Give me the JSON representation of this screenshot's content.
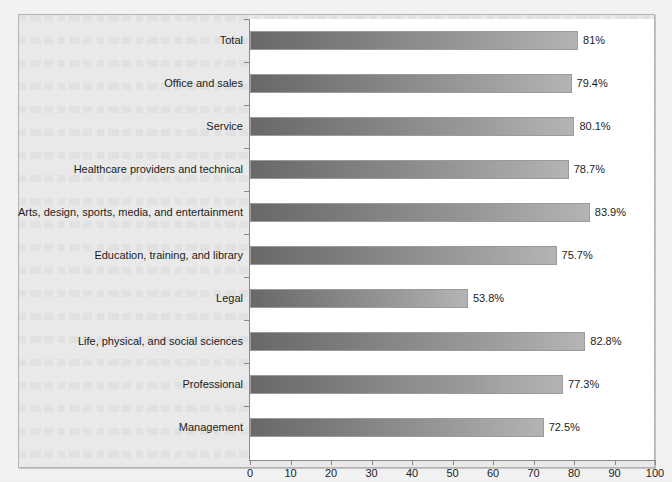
{
  "chart_data": {
    "type": "bar",
    "orientation": "horizontal",
    "title": "",
    "subtitle": "",
    "xlabel": "",
    "ylabel": "",
    "xlim": [
      0,
      100
    ],
    "xticks": [
      0,
      10,
      20,
      30,
      40,
      50,
      60,
      70,
      80,
      90,
      100
    ],
    "grid": false,
    "legend": null,
    "value_label_suffix": "%",
    "categories": [
      "Total",
      "Office and sales",
      "Service",
      "Healthcare providers and technical",
      "Arts, design, sports, media, and entertainment",
      "Education, training, and library",
      "Legal",
      "Life, physical, and social sciences",
      "Professional",
      "Management"
    ],
    "values": [
      81,
      79.4,
      80.1,
      78.7,
      83.9,
      75.7,
      53.8,
      82.8,
      77.3,
      72.5
    ],
    "value_labels": [
      "81%",
      "79.4%",
      "80.1%",
      "78.7%",
      "83.9%",
      "75.7%",
      "53.8%",
      "82.8%",
      "77.3%",
      "72.5%"
    ],
    "bars": [
      {
        "category": "Total",
        "value": 81,
        "label": "81%"
      },
      {
        "category": "Office and sales",
        "value": 79.4,
        "label": "79.4%"
      },
      {
        "category": "Service",
        "value": 80.1,
        "label": "80.1%"
      },
      {
        "category": "Healthcare providers and technical",
        "value": 78.7,
        "label": "78.7%"
      },
      {
        "category": "Arts, design, sports, media, and entertainment",
        "value": 83.9,
        "label": "83.9%"
      },
      {
        "category": "Education, training, and library",
        "value": 75.7,
        "label": "75.7%"
      },
      {
        "category": "Legal",
        "value": 53.8,
        "label": "53.8%"
      },
      {
        "category": "Life, physical, and social sciences",
        "value": 82.8,
        "label": "82.8%"
      },
      {
        "category": "Professional",
        "value": 77.3,
        "label": "77.3%"
      },
      {
        "category": "Management",
        "value": 72.5,
        "label": "72.5%"
      }
    ],
    "colors": {
      "bar_gradient_start": "#686868",
      "bar_gradient_end": "#b4b4b4",
      "bar_border": "#9b9b9b",
      "plot_background": "#ffffff",
      "chart_background": "#e9e9e9",
      "page_background": "#f2f2f2",
      "axis_line": "#8a8a8a",
      "text": "#1c1c1c"
    }
  }
}
